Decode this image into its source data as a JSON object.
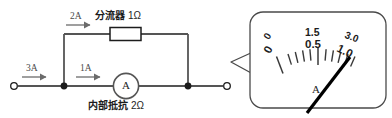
{
  "figure": {
    "kind": "circuit-diagram-with-meter-callout",
    "circuit": {
      "input_current": "3A",
      "ammeter_branch_current": "1A",
      "shunt_branch_current": "2A",
      "shunt_label_bold": "分流器",
      "shunt_label_value": "1Ω",
      "internal_resistance_label_bold": "内部抵抗",
      "internal_resistance_value": "2Ω",
      "ammeter_symbol": "A",
      "left_terminal": "terminal",
      "right_terminal": "terminal"
    },
    "meter": {
      "unit": "A",
      "outer_scale_min": "0",
      "outer_scale_mid": "1.5",
      "outer_scale_max": "3.0",
      "inner_scale_min": "0",
      "inner_scale_mid": "0.5",
      "inner_scale_max": "1.0",
      "needle_reading": "1.0",
      "colors": {
        "ink": "#1c1c1c",
        "wire": "#555555",
        "bubble_border": "#4a4a4a",
        "needle": "#000000"
      }
    }
  }
}
